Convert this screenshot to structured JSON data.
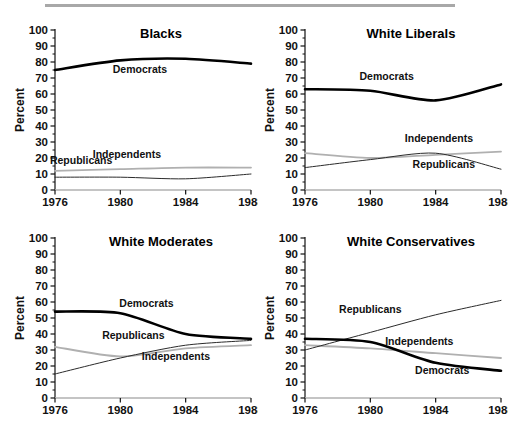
{
  "figure": {
    "background": "#ffffff",
    "rule_color": "#a8a8a8",
    "axis_label_y": "Percent",
    "y_ticks": [
      "100",
      "90",
      "80",
      "70",
      "60",
      "50",
      "40",
      "30",
      "20",
      "10",
      "0"
    ],
    "x_ticks": [
      "1976",
      "1980",
      "1984",
      "1988"
    ],
    "series_colors": {
      "democrats": "#000000",
      "republicans": "#2b2b2b",
      "independents": "#b0b0b0"
    }
  },
  "chart_data": [
    {
      "type": "line",
      "title": "Blacks",
      "xlabel": "",
      "ylabel": "Percent",
      "x": [
        1976,
        1980,
        1984,
        1988
      ],
      "xlim": [
        1976,
        1988
      ],
      "ylim": [
        0,
        100
      ],
      "ytick_step": 10,
      "grid": false,
      "legend": "inline-labels",
      "series": [
        {
          "name": "Democrats",
          "values": [
            75,
            81,
            82,
            79
          ],
          "label_x": 1981.2,
          "label_y": 73
        },
        {
          "name": "Republicans",
          "values": [
            8,
            8,
            7,
            10
          ],
          "label_x": 1977.6,
          "label_y": 16
        },
        {
          "name": "Independents",
          "values": [
            12,
            13,
            14,
            14
          ],
          "label_x": 1980.4,
          "label_y": 20
        }
      ]
    },
    {
      "type": "line",
      "title": "White Liberals",
      "xlabel": "",
      "ylabel": "Percent",
      "x": [
        1976,
        1980,
        1984,
        1988
      ],
      "xlim": [
        1976,
        1988
      ],
      "ylim": [
        0,
        100
      ],
      "ytick_step": 10,
      "grid": false,
      "legend": "inline-labels",
      "series": [
        {
          "name": "Democrats",
          "values": [
            63,
            62,
            56,
            66
          ],
          "label_x": 1981.0,
          "label_y": 69
        },
        {
          "name": "Republicans",
          "values": [
            14,
            19,
            23,
            13
          ],
          "label_x": 1984.5,
          "label_y": 14
        },
        {
          "name": "Independents",
          "values": [
            23,
            20,
            22,
            24
          ],
          "label_x": 1984.2,
          "label_y": 30
        }
      ]
    },
    {
      "type": "line",
      "title": "White Moderates",
      "xlabel": "",
      "ylabel": "Percent",
      "x": [
        1976,
        1980,
        1984,
        1988
      ],
      "xlim": [
        1976,
        1988
      ],
      "ylim": [
        0,
        100
      ],
      "ytick_step": 10,
      "grid": false,
      "legend": "inline-labels",
      "series": [
        {
          "name": "Democrats",
          "values": [
            54,
            53,
            40,
            37
          ],
          "label_x": 1981.6,
          "label_y": 57
        },
        {
          "name": "Republicans",
          "values": [
            15,
            25,
            33,
            36
          ],
          "label_x": 1980.8,
          "label_y": 37
        },
        {
          "name": "Independents",
          "values": [
            32,
            26,
            31,
            33
          ],
          "label_x": 1983.4,
          "label_y": 24
        }
      ]
    },
    {
      "type": "line",
      "title": "White Conservatives",
      "xlabel": "",
      "ylabel": "Percent",
      "x": [
        1976,
        1980,
        1984,
        1988
      ],
      "xlim": [
        1976,
        1988
      ],
      "ylim": [
        0,
        100
      ],
      "ytick_step": 10,
      "grid": false,
      "legend": "inline-labels",
      "series": [
        {
          "name": "Democrats",
          "values": [
            37,
            35,
            22,
            17
          ],
          "label_x": 1984.4,
          "label_y": 15
        },
        {
          "name": "Republicans",
          "values": [
            30,
            41,
            52,
            61
          ],
          "label_x": 1980.0,
          "label_y": 53
        },
        {
          "name": "Independents",
          "values": [
            33,
            31,
            28,
            25
          ],
          "label_x": 1983.0,
          "label_y": 33
        }
      ]
    }
  ]
}
